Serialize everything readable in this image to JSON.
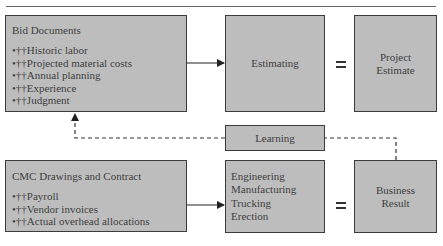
{
  "diagram": {
    "bid_documents": {
      "title": "Bid Documents",
      "items": [
        "•††Historic labor",
        "•††Projected material costs",
        "•††Annual planning",
        "•††Experience",
        "•††Judgment"
      ]
    },
    "estimating": {
      "label": "Estimating"
    },
    "equals_top": {
      "symbol": "="
    },
    "project_estimate": {
      "line1": "Project",
      "line2": "Estimate"
    },
    "learning": {
      "label": "Learning"
    },
    "cmc": {
      "title": "CMC Drawings and Contract",
      "items": [
        "•††Payroll",
        "•††Vendor invoices",
        "•††Actual overhead allocations"
      ]
    },
    "operations": {
      "items": [
        "Engineering",
        "Manufacturing",
        "Trucking",
        "Erection"
      ]
    },
    "equals_bottom": {
      "symbol": "="
    },
    "business_result": {
      "line1": "Business",
      "line2": "Result"
    },
    "colors": {
      "box_fill": "#bdbdbd",
      "border": "#3c3c3c",
      "text": "#3f3f3f"
    }
  }
}
